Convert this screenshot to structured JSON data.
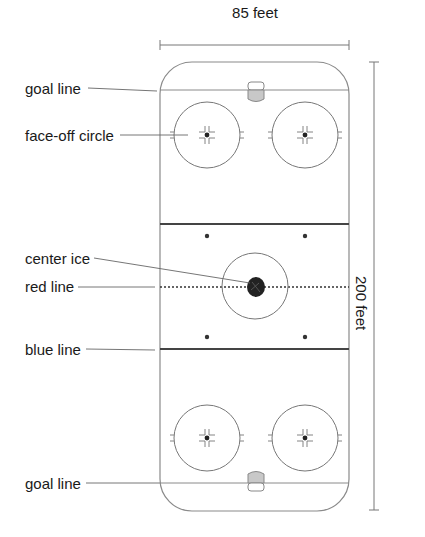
{
  "dimensions": {
    "width_label": "85 feet",
    "length_label": "200 feet"
  },
  "labels": {
    "goal_line_top": "goal line",
    "faceoff_circle": "face-off circle",
    "center_ice": "center ice",
    "red_line": "red line",
    "blue_line": "blue line",
    "goal_line_bottom": "goal line"
  },
  "colors": {
    "rink_outline": "#8a8a8a",
    "lines": "#444444",
    "crease_fill": "#c8c8c8",
    "text": "#1a1a1a"
  }
}
